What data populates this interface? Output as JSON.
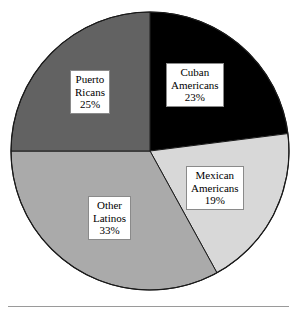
{
  "chart_data": {
    "type": "pie",
    "title": "",
    "subtitle": "",
    "xlabel": "",
    "ylabel": "",
    "legend_position": "none",
    "grid": false,
    "labels_inside": true,
    "start_angle_deg": 0,
    "direction": "clockwise",
    "categories": [
      "Cuban Americans",
      "Mexican Americans",
      "Other Latinos",
      "Puerto Ricans"
    ],
    "values": [
      23,
      19,
      33,
      25
    ],
    "value_unit": "%",
    "slices": [
      {
        "name": "Cuban Americans",
        "value": 23,
        "value_text": "23%",
        "color": "#000000",
        "label_lines": [
          "Cuban",
          "Americans",
          "23%"
        ]
      },
      {
        "name": "Mexican Americans",
        "value": 19,
        "value_text": "19%",
        "color": "#d8d8d8",
        "label_lines": [
          "Mexican",
          "Americans",
          "19%"
        ]
      },
      {
        "name": "Other Latinos",
        "value": 33,
        "value_text": "33%",
        "color": "#aaaaaa",
        "label_lines": [
          "Other",
          "Latinos",
          "33%"
        ]
      },
      {
        "name": "Puerto Ricans",
        "value": 25,
        "value_text": "25%",
        "color": "#626262",
        "label_lines": [
          "Puerto",
          "Ricans",
          "25%"
        ]
      }
    ],
    "geometry": {
      "center_x": 150,
      "center_y": 151,
      "radius": 139,
      "outline_color": "#1a1a1a"
    }
  },
  "footer": {
    "rule_color": "#9a9a9a"
  }
}
